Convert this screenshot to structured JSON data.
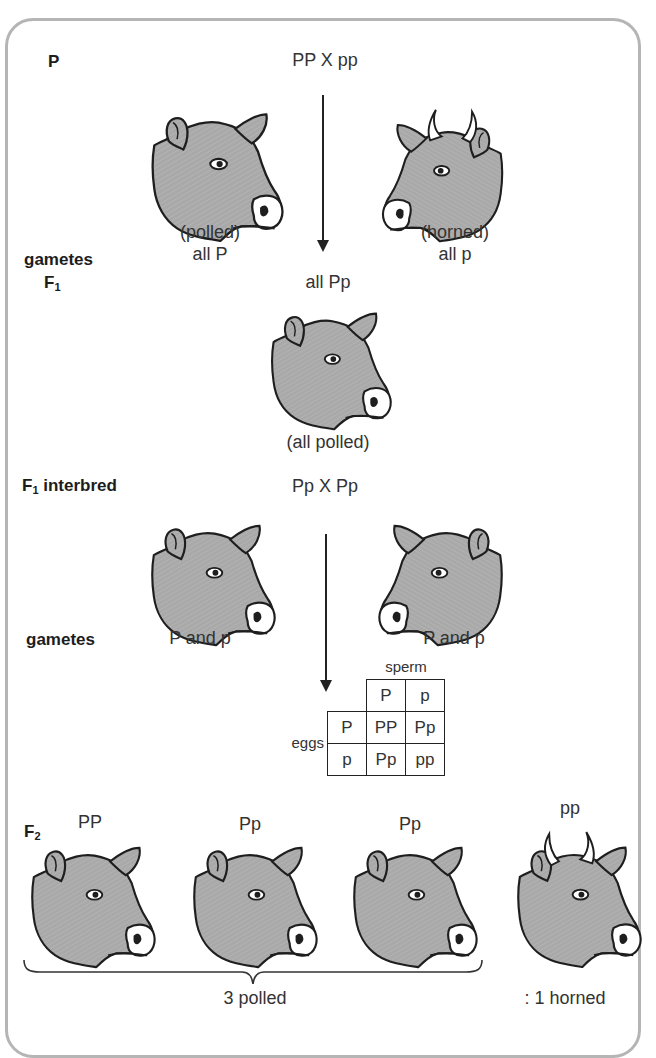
{
  "labels": {
    "parents": "P",
    "gametes_1": "gametes",
    "f1": "F",
    "f1_sub": "1",
    "f1_interbred": "F",
    "f1_interbred_sub": "1",
    "f1_interbred_rest": " interbred",
    "gametes_2": "gametes",
    "f2": "F",
    "f2_sub": "2"
  },
  "cross_1": {
    "title": "PP X pp",
    "left_phenotype": "(polled)",
    "left_gametes": "all P",
    "right_phenotype": "(horned)",
    "right_gametes": "all p",
    "offspring_genotype": "all Pp",
    "offspring_phenotype": "(all polled)"
  },
  "cross_2": {
    "title": "Pp X Pp",
    "left_gametes": "P and p",
    "right_gametes": "P and p"
  },
  "punnett": {
    "top_label": "sperm",
    "side_label": "eggs",
    "col_headers": [
      "P",
      "p"
    ],
    "row_headers": [
      "P",
      "p"
    ],
    "cells": [
      [
        "PP",
        "Pp"
      ],
      [
        "Pp",
        "pp"
      ]
    ]
  },
  "f2": {
    "genotypes": [
      "PP",
      "Pp",
      "Pp",
      "pp"
    ],
    "ratio_polled": "3 polled",
    "ratio_horned": ": 1 horned"
  },
  "colors": {
    "cow_fill": "#a9a9a9",
    "outline": "#1e1e1e",
    "frame": "#b5b5b5"
  }
}
